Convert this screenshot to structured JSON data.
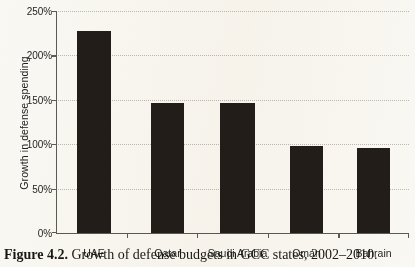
{
  "figure": {
    "caption_number": "Figure 4.2.",
    "caption_text": "Growth of defense budgets in GCC states, 2002–2010."
  },
  "colors": {
    "bar": "#231d19",
    "axis": "#5c5a54",
    "gridline": "#b9b5ab",
    "background": "#faf8f3",
    "text": "#1e1e1c"
  },
  "chart_data": {
    "type": "bar",
    "title": "",
    "subtitle": "",
    "xlabel": "",
    "ylabel": "Growth in defense spending",
    "categories": [
      "UAE",
      "Qatar",
      "Saudi Arabia",
      "Oman",
      "Bahrain"
    ],
    "values": [
      227,
      147,
      146,
      98,
      96
    ],
    "value_unit": "percent",
    "ylim": [
      0,
      250
    ],
    "ytick_values": [
      0,
      50,
      100,
      150,
      200,
      250
    ],
    "ytick_labels": [
      "0%",
      "50%",
      "100%",
      "150%",
      "200%",
      "250%"
    ],
    "grid": true,
    "grid_style": "dotted-horizontal",
    "legend": false,
    "legend_position": "none",
    "series": [
      {
        "name": "Growth in defense spending",
        "values": [
          227,
          147,
          146,
          98,
          96
        ]
      }
    ],
    "annotations": []
  }
}
